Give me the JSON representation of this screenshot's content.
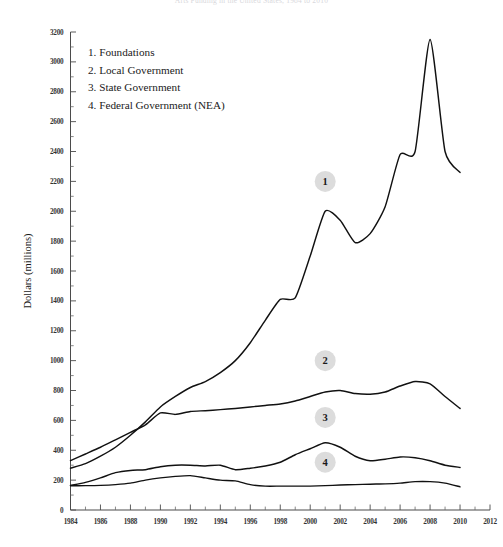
{
  "figure": {
    "title": "Arts Funding in the United States, 1984 to 2010",
    "y_axis_title": "Dollars (millions)"
  },
  "legend": {
    "position": "upper-left-inside",
    "items": [
      {
        "num": "1.",
        "label": "Foundations"
      },
      {
        "num": "2.",
        "label": "Local Government"
      },
      {
        "num": "3.",
        "label": "State Government"
      },
      {
        "num": "4.",
        "label": "Federal Government (NEA)"
      }
    ]
  },
  "markers": [
    {
      "id": "1",
      "label": "1",
      "x_year": 2001.0,
      "y_value": 2200
    },
    {
      "id": "2",
      "label": "2",
      "x_year": 2001.0,
      "y_value": 1000
    },
    {
      "id": "3",
      "label": "3",
      "x_year": 2001.0,
      "y_value": 620
    },
    {
      "id": "4",
      "label": "4",
      "x_year": 2001.0,
      "y_value": 320
    }
  ],
  "chart_data": {
    "type": "line",
    "title": "Arts Funding in the United States, 1984 to 2010",
    "xlabel": "",
    "ylabel": "Dollars (millions)",
    "xlim": [
      1984,
      2012
    ],
    "ylim": [
      0,
      3200
    ],
    "ytick_step": 200,
    "yticks": [
      0,
      200,
      400,
      600,
      800,
      1000,
      1200,
      1400,
      1600,
      1800,
      2000,
      2200,
      2400,
      2600,
      2800,
      3000,
      3200
    ],
    "xticks": [
      1984,
      1986,
      1988,
      1990,
      1992,
      1994,
      1996,
      1998,
      2000,
      2002,
      2004,
      2006,
      2008,
      2010,
      2012
    ],
    "xticks_minor": [
      1985,
      1987,
      1989,
      1991,
      1993,
      1995,
      1997,
      1999,
      2001,
      2003,
      2005,
      2007,
      2009,
      2011
    ],
    "grid": false,
    "legend_position": "inside-upper-left",
    "x": [
      1984,
      1985,
      1986,
      1987,
      1988,
      1989,
      1990,
      1991,
      1992,
      1993,
      1994,
      1995,
      1996,
      1997,
      1998,
      1999,
      2000,
      2001,
      2002,
      2003,
      2004,
      2005,
      2006,
      2007,
      2008,
      2009,
      2010
    ],
    "series": [
      {
        "name": "Foundations",
        "marker": "1",
        "values": [
          280,
          310,
          360,
          420,
          500,
          590,
          690,
          760,
          820,
          860,
          920,
          1000,
          1120,
          1270,
          1410,
          1420,
          1700,
          2000,
          1940,
          1790,
          1850,
          2030,
          2380,
          2400,
          3150,
          2400,
          2260
        ]
      },
      {
        "name": "Local Government",
        "marker": "2",
        "values": [
          330,
          375,
          420,
          470,
          520,
          570,
          650,
          640,
          660,
          665,
          672,
          680,
          690,
          700,
          710,
          730,
          760,
          790,
          800,
          780,
          775,
          790,
          830,
          860,
          845,
          760,
          680
        ]
      },
      {
        "name": "State Government",
        "marker": "3",
        "values": [
          165,
          185,
          215,
          250,
          265,
          270,
          290,
          300,
          300,
          295,
          300,
          270,
          280,
          295,
          320,
          370,
          410,
          450,
          420,
          360,
          330,
          340,
          355,
          350,
          330,
          300,
          285
        ]
      },
      {
        "name": "Federal Government (NEA)",
        "marker": "4",
        "values": [
          162,
          163,
          165,
          170,
          180,
          200,
          215,
          225,
          230,
          215,
          200,
          195,
          170,
          160,
          160,
          160,
          160,
          163,
          167,
          170,
          173,
          175,
          180,
          190,
          190,
          180,
          155
        ]
      }
    ]
  }
}
